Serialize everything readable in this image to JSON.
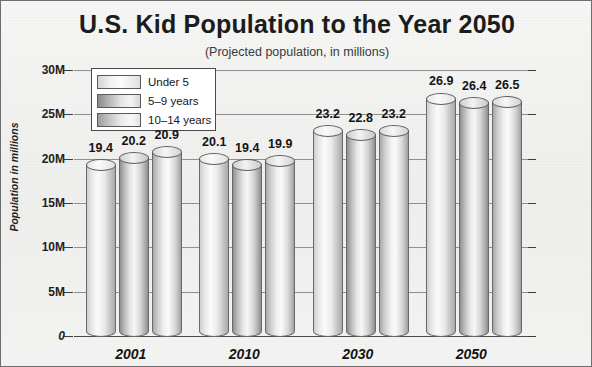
{
  "chart_data": {
    "type": "bar",
    "title": "U.S. Kid Population to the Year 2050",
    "subtitle": "(Projected population, in millions)",
    "xlabel": "",
    "ylabel": "Population in millions",
    "categories": [
      "2001",
      "2010",
      "2030",
      "2050"
    ],
    "series": [
      {
        "name": "Under 5",
        "values": [
          19.4,
          20.1,
          23.2,
          26.9
        ]
      },
      {
        "name": "5-9 years",
        "values": [
          20.2,
          19.4,
          22.8,
          26.4
        ]
      },
      {
        "name": "10-14 years",
        "values": [
          20.9,
          19.9,
          23.2,
          26.5
        ]
      }
    ],
    "ylim": [
      0,
      30
    ],
    "yticks": [
      0,
      5,
      10,
      15,
      20,
      25,
      30
    ],
    "ytick_labels": [
      "0",
      "5M",
      "10M",
      "15M",
      "20M",
      "25M",
      "30M"
    ],
    "grid": true,
    "legend_position": "top-left",
    "bar_style": "cylinder",
    "value_labels_shown": true,
    "colors": {
      "frame_border": "#6e6e6e",
      "background": "#f2f2f0",
      "axis": "#3d3d3d",
      "gridline": "#8f8f8f",
      "text": "#141414",
      "legend_background": "#ffffff"
    }
  },
  "legend": {
    "items": [
      {
        "label": "Under 5"
      },
      {
        "label": "5–9 years"
      },
      {
        "label": "10–14 years"
      }
    ]
  }
}
